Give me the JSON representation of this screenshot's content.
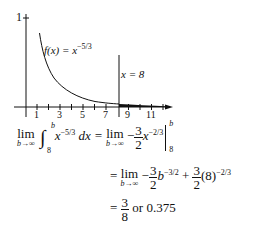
{
  "figure": {
    "type": "function-graph",
    "function_label": "f(x) = x^{-5/3}",
    "function_label_parts": {
      "f": "f",
      "x": "(x) = x",
      "exp": "−5/3"
    },
    "y_tick_label": "1",
    "x_tick_labels": [
      "1",
      "3",
      "5",
      "7",
      "9",
      "11"
    ],
    "vertical_line_label": "x = 8",
    "vertical_line_x": 8,
    "shaded_region": "area under curve for x ≥ 8",
    "colors": {
      "ink": "#111111",
      "background": "#ffffff"
    }
  },
  "equations": {
    "line1": {
      "lim": "lim",
      "lim_sub": "b→∞",
      "integral": "∫",
      "upper": "b",
      "lower": "8",
      "integrand": "x",
      "integrand_exp": "−5/3",
      "dx": "dx =",
      "rhs_lim": "lim",
      "rhs_lim_sub": "b→∞",
      "minus": "−",
      "frac_num": "3",
      "frac_den": "2",
      "term": "x",
      "term_exp": "−2/3",
      "eval_upper": "b",
      "eval_lower": "8"
    },
    "line2": {
      "eq": "=",
      "lim": "lim",
      "lim_sub": "b→∞",
      "minus": "−",
      "frac1_num": "3",
      "frac1_den": "2",
      "term1": "b",
      "term1_exp": "−3/2",
      "plus": "+",
      "frac2_num": "3",
      "frac2_den": "2",
      "term2": "(8)",
      "term2_exp": "−2/3"
    },
    "line3": {
      "eq": "=",
      "frac_num": "3",
      "frac_den": "8",
      "tail": "or 0.375"
    }
  }
}
